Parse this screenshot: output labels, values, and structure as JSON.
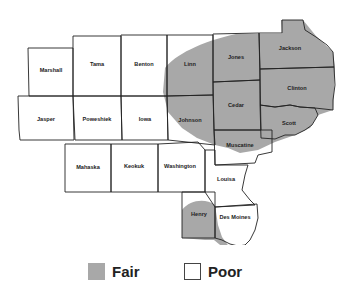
{
  "map": {
    "counties": [
      {
        "name": "Marshall",
        "rating": "Poor"
      },
      {
        "name": "Tama",
        "rating": "Poor"
      },
      {
        "name": "Benton",
        "rating": "Poor"
      },
      {
        "name": "Linn",
        "rating": "Fair"
      },
      {
        "name": "Jones",
        "rating": "Fair"
      },
      {
        "name": "Jackson",
        "rating": "Fair"
      },
      {
        "name": "Jasper",
        "rating": "Poor"
      },
      {
        "name": "Poweshiek",
        "rating": "Poor"
      },
      {
        "name": "Iowa",
        "rating": "Poor"
      },
      {
        "name": "Johnson",
        "rating": "Fair"
      },
      {
        "name": "Cedar",
        "rating": "Fair"
      },
      {
        "name": "Clinton",
        "rating": "Fair"
      },
      {
        "name": "Scott",
        "rating": "Fair"
      },
      {
        "name": "Muscatine",
        "rating": "Fair"
      },
      {
        "name": "Mahaska",
        "rating": "Poor"
      },
      {
        "name": "Keokuk",
        "rating": "Poor"
      },
      {
        "name": "Washington",
        "rating": "Poor"
      },
      {
        "name": "Louisa",
        "rating": "Poor"
      },
      {
        "name": "Henry",
        "rating": "Fair"
      },
      {
        "name": "Des Moines",
        "rating": "Poor"
      }
    ]
  },
  "legend": {
    "items": [
      {
        "label": "Fair",
        "color": "#a8a8a8"
      },
      {
        "label": "Poor",
        "color": "#ffffff"
      }
    ]
  },
  "colors": {
    "fair": "#a8a8a8",
    "border": "#222222"
  }
}
